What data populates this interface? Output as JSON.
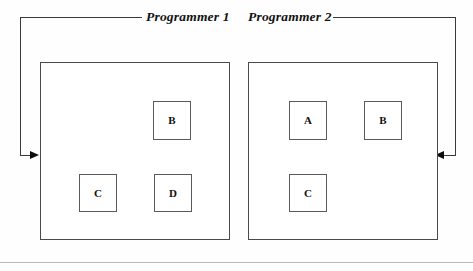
{
  "figure": {
    "background_color": "#fefefe",
    "line_color": "#3a3a3a",
    "box_border_color": "#5a5a5a",
    "arrow_color": "#0d0d0d",
    "rule_color": "#b9b9b9"
  },
  "flow_labels": [
    {
      "text": "Programmer 1",
      "x": 146,
      "y": 10
    },
    {
      "text": "Programmer 2",
      "x": 248,
      "y": 10
    }
  ],
  "panels": [
    {
      "name": "programmer-1",
      "title": "Programmer 1",
      "x": 40,
      "y": 62,
      "width": 190,
      "height": 178,
      "modules": [
        {
          "label": "B",
          "x": 112,
          "y": 38,
          "width": 38,
          "height": 39
        },
        {
          "label": "C",
          "x": 38,
          "y": 111,
          "width": 38,
          "height": 38
        },
        {
          "label": "D",
          "x": 113,
          "y": 111,
          "width": 38,
          "height": 38
        }
      ]
    },
    {
      "name": "programmer-2",
      "title": "Programmer 2",
      "x": 248,
      "y": 62,
      "width": 190,
      "height": 178,
      "modules": [
        {
          "label": "A",
          "x": 40,
          "y": 38,
          "width": 38,
          "height": 39
        },
        {
          "label": "B",
          "x": 115,
          "y": 38,
          "width": 38,
          "height": 39
        },
        {
          "label": "C",
          "x": 40,
          "y": 111,
          "width": 38,
          "height": 38
        }
      ]
    }
  ],
  "connectors": {
    "left": {
      "name": "feedback-arrow-left",
      "top_line": {
        "x": 20,
        "y": 17,
        "width": 122
      },
      "vertical": {
        "x": 20,
        "y": 17,
        "height": 138
      },
      "bottom_stub": {
        "x": 20,
        "y": 155,
        "width": 12
      },
      "arrowhead": {
        "x": 30,
        "y": 151,
        "direction": "right"
      }
    },
    "right": {
      "name": "feedback-arrow-right",
      "top_line": {
        "x": 333,
        "y": 17,
        "width": 122
      },
      "vertical": {
        "x": 455,
        "y": 17,
        "height": 138
      },
      "bottom_stub": {
        "x": 444,
        "y": 155,
        "width": 12
      },
      "arrowhead": {
        "x": 435,
        "y": 151,
        "direction": "left"
      }
    }
  },
  "page_rule": {
    "y": 262
  }
}
